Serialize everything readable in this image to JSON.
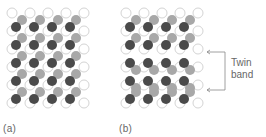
{
  "figure": {
    "panels": [
      {
        "id": "a",
        "label": "(a)",
        "description": "Perfect crystal lattice"
      },
      {
        "id": "b",
        "label": "(b)",
        "description": "Crystal with twin band"
      }
    ],
    "annotation": {
      "line1": "Twin",
      "line2": "band"
    },
    "colors": {
      "dark_atom": "#4a4a4a",
      "gray_atom": "#a8a8a8",
      "open_atom_stroke": "#d4d4d4"
    },
    "lattice": {
      "columns": 4,
      "rows": 5,
      "twin_band_rows_in_b": [
        3,
        4
      ]
    }
  }
}
